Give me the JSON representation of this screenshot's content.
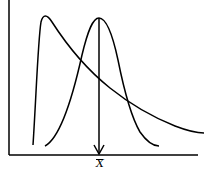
{
  "diagram": {
    "title": "",
    "curves": [
      {
        "name": "skewed-distribution",
        "shape": "right-skewed"
      },
      {
        "name": "normal-distribution",
        "shape": "symmetric"
      }
    ],
    "marker": {
      "label": "X",
      "overbar": true,
      "meaning": "mean (x-bar)"
    },
    "colors": {
      "stroke": "#000000",
      "background": "#ffffff"
    }
  }
}
